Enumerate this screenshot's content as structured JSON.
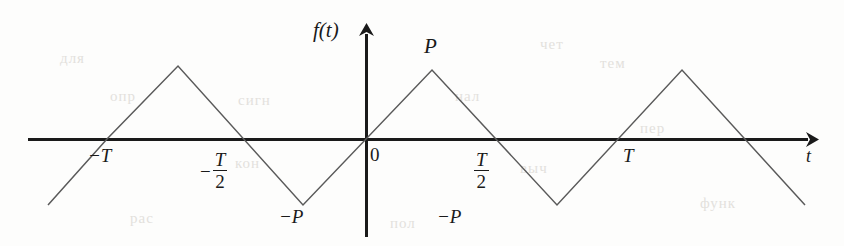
{
  "figure": {
    "axis_labels": {
      "y_axis": "f(t)",
      "x_axis": "t"
    },
    "origin_label": "0",
    "amplitude_positive_label": "P",
    "amplitude_negative_label": "−P",
    "amplitude_negative_label_2": "−P",
    "tick_labels": {
      "neg_period": "−T",
      "neg_half_period_sign": "−",
      "neg_half_period_num": "T",
      "neg_half_period_den": "2",
      "half_period_num": "T",
      "half_period_den": "2",
      "period": "T"
    },
    "colors": {
      "axis": "#1a1a1a",
      "waveform": "#5a5a5a",
      "background": "#fdfdfc",
      "bleed_through": "#e3e1dc"
    }
  },
  "chart_data": {
    "type": "line",
    "xlabel": "t",
    "ylabel": "f(t)",
    "period": "T",
    "amplitude": "P",
    "xlim": [
      -1.55,
      1.55
    ],
    "ylim": [
      -1.22,
      1.22
    ],
    "grid": false,
    "legend": null,
    "x_tick_labels": [
      "−T",
      "−T/2",
      "0",
      "T/2",
      "T"
    ],
    "x_tick_values": [
      -1,
      -0.5,
      0,
      0.5,
      1
    ],
    "y_annotations": [
      "P",
      "−P"
    ],
    "series": [
      {
        "name": "f(t)",
        "x": [
          -1.47,
          -1.25,
          -1.0,
          -0.75,
          -0.5,
          -0.25,
          0,
          0.25,
          0.5,
          0.75,
          1.0,
          1.25,
          1.47
        ],
        "y": [
          -0.94,
          0,
          0.56,
          1.0,
          0.55,
          0,
          -0.55,
          -1.0,
          -0.55,
          0,
          0.55,
          1.0,
          0.55
        ]
      }
    ],
    "vertices_pixel": [
      {
        "x": 48,
        "y": 205
      },
      {
        "x": 107,
        "y": 139
      },
      {
        "x": 178,
        "y": 66
      },
      {
        "x": 303,
        "y": 205
      },
      {
        "x": 432,
        "y": 70
      },
      {
        "x": 557,
        "y": 205
      },
      {
        "x": 682,
        "y": 70
      },
      {
        "x": 805,
        "y": 205
      }
    ]
  },
  "bleed_through": [
    {
      "text": "чет",
      "x": 540,
      "y": 36
    },
    {
      "text": "опр",
      "x": 110,
      "y": 88
    },
    {
      "text": "сигн",
      "x": 238,
      "y": 92
    },
    {
      "text": "нал",
      "x": 455,
      "y": 88
    },
    {
      "text": "тем",
      "x": 600,
      "y": 55
    },
    {
      "text": "пер",
      "x": 640,
      "y": 120
    },
    {
      "text": "выч",
      "x": 520,
      "y": 160
    },
    {
      "text": "кон",
      "x": 235,
      "y": 155
    },
    {
      "text": "функ",
      "x": 700,
      "y": 195
    },
    {
      "text": "рас",
      "x": 130,
      "y": 210
    },
    {
      "text": "пол",
      "x": 390,
      "y": 215
    },
    {
      "text": "для",
      "x": 60,
      "y": 50
    }
  ]
}
